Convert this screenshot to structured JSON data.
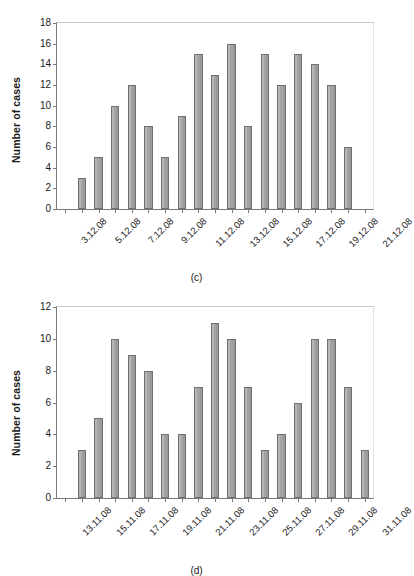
{
  "figure": {
    "panels": [
      {
        "id": "c",
        "caption": "(c)",
        "ylabel": "Number of cases"
      },
      {
        "id": "d",
        "caption": "(d)",
        "ylabel": "Number of cases"
      }
    ]
  },
  "chart_data": [
    {
      "type": "bar",
      "panel": "(c)",
      "title": "",
      "xlabel": "",
      "ylabel": "Number of cases",
      "ylim": [
        0,
        18
      ],
      "ytick_step": 2,
      "yticks": [
        0,
        2,
        4,
        6,
        8,
        10,
        12,
        14,
        16,
        18
      ],
      "ytick_labels": [
        "0",
        "2",
        "4",
        "6",
        "8",
        "10",
        "12",
        "14",
        "16",
        "18"
      ],
      "grid": false,
      "legend": null,
      "tick_label_rotation": -45,
      "categories": [
        "3.12.08",
        "4.12.08",
        "5.12.08",
        "6.12.08",
        "7.12.08",
        "8.12.08",
        "9.12.08",
        "10.12.08",
        "11.12.08",
        "12.12.08",
        "13.12.08",
        "14.12.08",
        "15.12.08",
        "16.12.08",
        "17.12.08",
        "18.12.08",
        "19.12.08",
        "20.12.08",
        "21.12.08"
      ],
      "visible_tick_labels": [
        "3.12.08",
        "5.12.08",
        "7.12.08",
        "9.12.08",
        "11.12.08",
        "13.12.08",
        "15.12.08",
        "17.12.08",
        "19.12.08",
        "21.12.08"
      ],
      "values": [
        0,
        3,
        5,
        10,
        12,
        8,
        5,
        9,
        15,
        13,
        16,
        8,
        15,
        12,
        15,
        14,
        12,
        6,
        0
      ]
    },
    {
      "type": "bar",
      "panel": "(d)",
      "title": "",
      "xlabel": "",
      "ylabel": "Number of cases",
      "ylim": [
        0,
        12
      ],
      "ytick_step": 2,
      "yticks": [
        0,
        2,
        4,
        6,
        8,
        10,
        12
      ],
      "ytick_labels": [
        "0",
        "2",
        "4",
        "6",
        "8",
        "10",
        "12"
      ],
      "grid": false,
      "legend": null,
      "tick_label_rotation": -45,
      "categories": [
        "13.11.08",
        "14.11.08",
        "15.11.08",
        "16.11.08",
        "17.11.08",
        "18.11.08",
        "19.11.08",
        "20.11.08",
        "21.11.08",
        "22.11.08",
        "23.11.08",
        "24.11.08",
        "25.11.08",
        "26.11.08",
        "27.11.08",
        "28.11.08",
        "29.11.08",
        "30.11.08",
        "31.11.08"
      ],
      "visible_tick_labels": [
        "13.11.08",
        "15.11.08",
        "17.11.08",
        "19.11.08",
        "21.11.08",
        "23.11.08",
        "25.11.08",
        "27.11.08",
        "29.11.08",
        "31.11.08"
      ],
      "values": [
        0,
        3,
        5,
        10,
        9,
        8,
        4,
        4,
        7,
        11,
        10,
        7,
        3,
        4,
        6,
        10,
        10,
        7,
        3
      ]
    }
  ],
  "style": {
    "bar_fill": "#a3a3a3",
    "bar_stroke": "#6f6f6f",
    "axis_color": "#7a7a7a",
    "text_color": "#1a1a1a",
    "background": "#ffffff"
  }
}
